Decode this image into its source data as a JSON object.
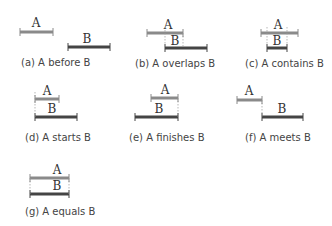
{
  "colors": {
    "a_bar": "#888888",
    "b_bar": "#444444",
    "text": "#444444",
    "guide": "#999999"
  },
  "panels": [
    {
      "id": "a",
      "caption": "(a) A before B",
      "label_a": "A",
      "label_b": "B"
    },
    {
      "id": "b",
      "caption": "(b) A overlaps B",
      "label_a": "A",
      "label_b": "B"
    },
    {
      "id": "c",
      "caption": "(c) A contains B",
      "label_a": "A",
      "label_b": "B"
    },
    {
      "id": "d",
      "caption": "(d) A starts B",
      "label_a": "A",
      "label_b": "B"
    },
    {
      "id": "e",
      "caption": "(e) A finishes B",
      "label_a": "A",
      "label_b": "B"
    },
    {
      "id": "f",
      "caption": "(f) A meets B",
      "label_a": "A",
      "label_b": "B"
    },
    {
      "id": "g",
      "caption": "(g) A equals B",
      "label_a": "A",
      "label_b": "B"
    }
  ]
}
